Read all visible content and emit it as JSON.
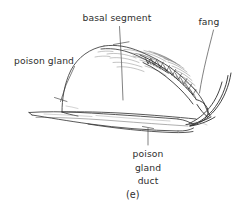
{
  "figure": {
    "caption": "(e)",
    "background_color": "#ffffff",
    "ink_color": "#2b2b2b",
    "labels": {
      "basal_segment": "basal segment",
      "poison_gland": "poison gland",
      "fang": "fang",
      "poison_gland_duct_line1": "poison",
      "poison_gland_duct_line2": "gland",
      "poison_gland_duct_line3": "duct"
    },
    "parts": {
      "basal_segment": "basal-segment-dome",
      "fang": "curved-fang-claw",
      "serrations": "serrated-tooth-row",
      "lower_segment": "tapered-lower-segment",
      "duct": "poison-gland-duct-channel"
    }
  }
}
